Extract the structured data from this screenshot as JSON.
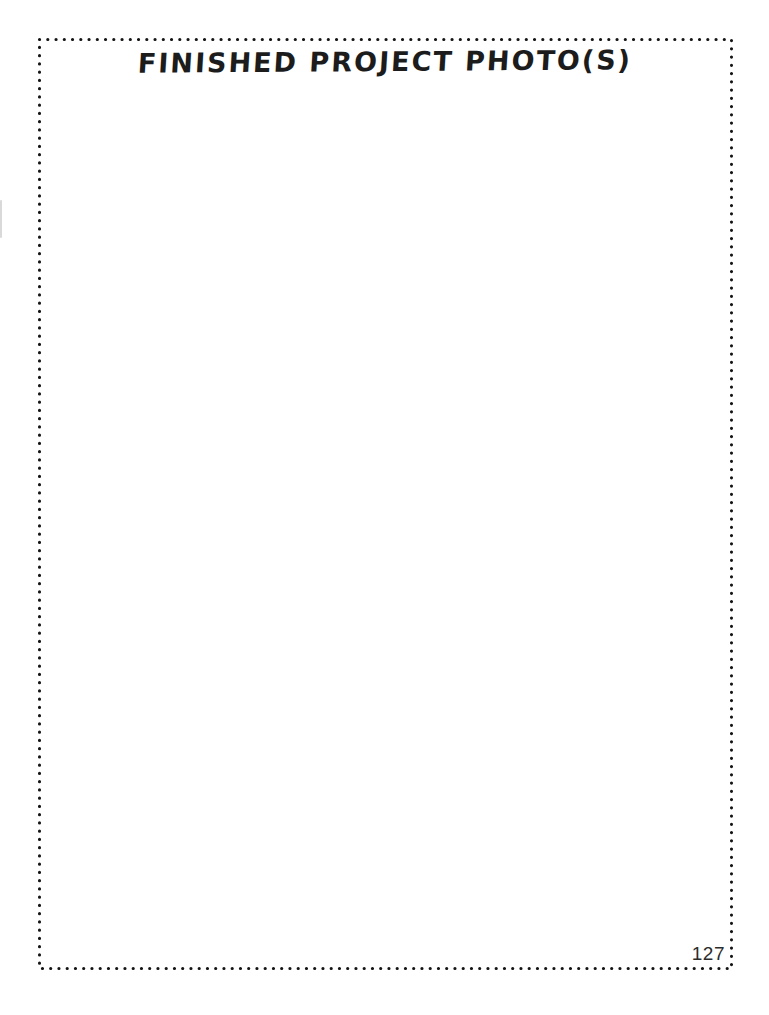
{
  "page": {
    "title": "FINISHED PROJECT PHOTO(S)",
    "page_number": "127"
  },
  "colors": {
    "ink": "#1c1c1c",
    "dot_border": "#141414",
    "background": "#ffffff"
  },
  "border": {
    "style": "dotted-rectangle",
    "dot_diameter_px": 3,
    "dot_pitch_px": 8
  }
}
